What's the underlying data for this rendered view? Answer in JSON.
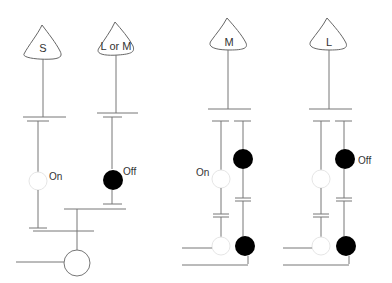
{
  "diagram": {
    "panels": [
      {
        "id": "left",
        "heads": [
          {
            "label": "S",
            "x": 43
          },
          {
            "label": "L or M",
            "x": 116
          }
        ],
        "states": [
          {
            "label": "On",
            "color": "white"
          },
          {
            "label": "Off",
            "color": "black"
          }
        ]
      },
      {
        "id": "middle",
        "head": {
          "label": "M",
          "x": 228
        },
        "state_label": "On"
      },
      {
        "id": "right",
        "head": {
          "label": "L",
          "x": 329
        },
        "state_label": "Off"
      }
    ],
    "colors": {
      "line": "#777777",
      "filled_circle": "#000000",
      "empty_circle_stroke": "#e6e6e6",
      "background": "#ffffff"
    }
  }
}
